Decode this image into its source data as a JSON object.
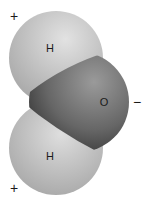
{
  "diagram": {
    "atoms": [
      {
        "label": "H",
        "role": "hydrogen-top"
      },
      {
        "label": "O",
        "role": "oxygen"
      },
      {
        "label": "H",
        "role": "hydrogen-bottom"
      }
    ],
    "charges": {
      "top_hydrogen": "+",
      "bottom_hydrogen": "+",
      "oxygen": "−"
    },
    "colors": {
      "hydrogen_light": "#dcdcdc",
      "hydrogen_dark": "#a9a9a9",
      "oxygen_light": "#8f8f8f",
      "oxygen_dark": "#3a3a3a"
    }
  }
}
